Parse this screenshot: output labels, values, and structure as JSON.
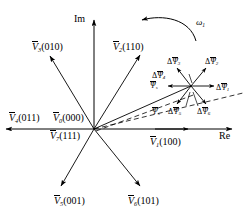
{
  "figure": {
    "background": "#ffffff",
    "stroke_color": "#000000",
    "width": 249,
    "height": 221
  },
  "axes": {
    "imaginary_label": "Im",
    "real_label": "Re"
  },
  "rotation": {
    "omega_label": "ω",
    "omega_sub": "1"
  },
  "voltage_vectors": [
    {
      "id": "v1",
      "sym": "V",
      "sub": "1",
      "states": "(100)",
      "label": "V̄₁(100)",
      "angle_deg": 0
    },
    {
      "id": "v2",
      "sym": "V",
      "sub": "2",
      "states": "(110)",
      "label": "V̄₂(110)",
      "angle_deg": 60
    },
    {
      "id": "v3",
      "sym": "V",
      "sub": "3",
      "states": "(010)",
      "label": "V̄₃(010)",
      "angle_deg": 120
    },
    {
      "id": "v4",
      "sym": "V",
      "sub": "4",
      "states": "(011)",
      "label": "V̄₄(011)",
      "angle_deg": 180
    },
    {
      "id": "v5",
      "sym": "V",
      "sub": "5",
      "states": "(001)",
      "label": "V̄₅(001)",
      "angle_deg": 240
    },
    {
      "id": "v6",
      "sym": "V",
      "sub": "6",
      "states": "(101)",
      "label": "V̄₆(101)",
      "angle_deg": 300
    }
  ],
  "zero_vectors": [
    {
      "id": "v0",
      "sym": "V",
      "sub": "0",
      "states": "(000)",
      "label": "V̄₀(000)"
    },
    {
      "id": "v7",
      "sym": "V",
      "sub": "7",
      "states": "(111)",
      "label": "V̄₇(111)"
    }
  ],
  "flux_vector": {
    "sym": "Ψ",
    "sub": "s",
    "label": "Ψ̄ₛ",
    "occurrences": 2
  },
  "flux_increments": [
    {
      "id": "d1",
      "sym": "ΔΨ",
      "sub": "1",
      "label": "ΔΨ̄₁",
      "angle_deg": 0
    },
    {
      "id": "d2",
      "sym": "ΔΨ",
      "sub": "2",
      "label": "ΔΨ̄₂",
      "angle_deg": 60
    },
    {
      "id": "d3",
      "sym": "ΔΨ",
      "sub": "3",
      "label": "ΔΨ̄₃",
      "angle_deg": 120
    },
    {
      "id": "d4",
      "sym": "ΔΨ",
      "sub": "4",
      "label": "ΔΨ̄₄",
      "angle_deg": 180
    },
    {
      "id": "d5",
      "sym": "ΔΨ",
      "sub": "5",
      "label": "ΔΨ̄₅",
      "angle_deg": 240
    },
    {
      "id": "d6",
      "sym": "ΔΨ",
      "sub": "6",
      "label": "ΔΨ̄₆",
      "angle_deg": 300
    }
  ],
  "symbols": {
    "delta": "Δ",
    "psi": "Ψ",
    "vee": "V"
  }
}
